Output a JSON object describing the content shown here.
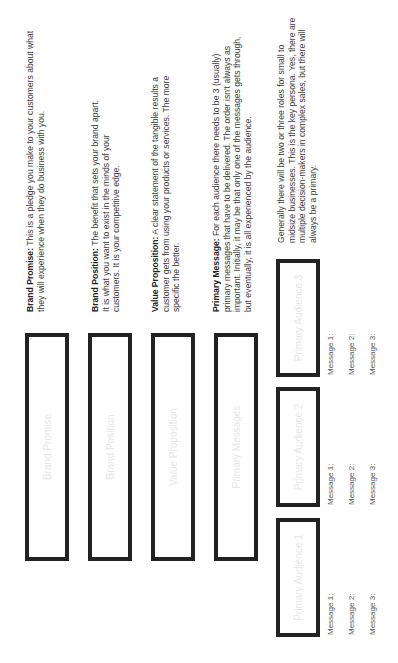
{
  "core_boxes": [
    {
      "label": "Brand Promise"
    },
    {
      "label": "Brand Position"
    },
    {
      "label": "Value Proposition"
    },
    {
      "label": "Primary Messages"
    }
  ],
  "descriptions": [
    {
      "term": "Brand Promise:",
      "text": " This is a pledge you make to your customers about what they will experience when they do business with you."
    },
    {
      "term": "Brand Position:",
      "text": " The benefit that sets your brand apart. It is what you want to exist in the minds of your customers. It is your competitive edge."
    },
    {
      "term": "Value Proposition:",
      "text": " A clear statement of the tangible results a customer gets from using your products or services. The more specific the better."
    },
    {
      "term": "Primary Message:",
      "text": " For each audience there needs to be 3 (usually) primary messages that have to be delivered. The order isn't always as important. Initially, it may be that only one of the messages gets through, but eventually, it is all experienced by the audience."
    }
  ],
  "audience_note": "Generally there will be two or three roles for small to midsize businesses. This is the key persona. Yes, there are multiple decision-makers in complex sales, but there will always be a primary.",
  "audiences": [
    {
      "label": "Primary Audience 1",
      "messages": [
        "Message 1:",
        "Message 2:",
        "Message 3:"
      ]
    },
    {
      "label": "Primary Audience 2",
      "messages": [
        "Message 1:",
        "Message 2:",
        "Message 3:"
      ]
    },
    {
      "label": "Primary Audience 3",
      "messages": [
        "Message 1:",
        "Message 2:",
        "Message 3:"
      ]
    }
  ],
  "colors": {
    "box_border": "#222222",
    "placeholder_text": "#e6e6e6",
    "body_text": "#3c3c3c"
  }
}
